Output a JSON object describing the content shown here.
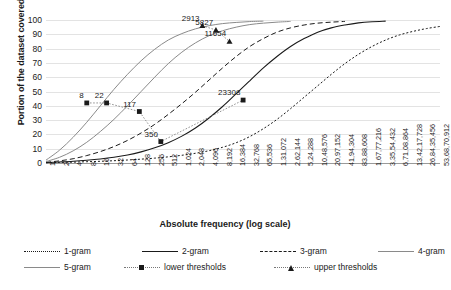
{
  "chart_data": {
    "type": "line",
    "title": "",
    "xlabel": "Absolute frequency (log scale)",
    "ylabel": "Portion of the dataset covered (%)",
    "xscale": "log2",
    "ylim": [
      0,
      100
    ],
    "yticks": [
      0,
      10,
      20,
      30,
      40,
      50,
      60,
      70,
      80,
      90,
      100
    ],
    "grid": true,
    "legend_position": "bottom",
    "xticks": [
      "1",
      "2",
      "4",
      "8",
      "16",
      "32",
      "64",
      "128",
      "256",
      "512",
      "1,024",
      "2,048",
      "4,096",
      "8,192",
      "16,384",
      "32,768",
      "65,536",
      "1,31,072",
      "2,62,144",
      "5,24,288",
      "10,48,576",
      "20,97,152",
      "41,94,304",
      "83,88,608",
      "1,67,77,216",
      "3,35,54,432",
      "6,71,08,864",
      "13,42,17,728",
      "26,84,35,456",
      "53,68,70,912"
    ],
    "xtick_values": [
      1,
      2,
      4,
      8,
      16,
      32,
      64,
      128,
      256,
      512,
      1024,
      2048,
      4096,
      8192,
      16384,
      32768,
      65536,
      131072,
      262144,
      524288,
      1048576,
      2097152,
      4194304,
      8388608,
      16777216,
      33554432,
      67108864,
      134217728,
      268435456,
      536870912
    ],
    "series": [
      {
        "name": "1-gram",
        "style": "dotted",
        "points": [
          [
            1,
            0.2
          ],
          [
            2,
            0.4
          ],
          [
            4,
            0.6
          ],
          [
            8,
            0.9
          ],
          [
            16,
            1.2
          ],
          [
            32,
            1.6
          ],
          [
            64,
            2.1
          ],
          [
            128,
            2.7
          ],
          [
            256,
            3.4
          ],
          [
            512,
            4.3
          ],
          [
            1024,
            5.4
          ],
          [
            2048,
            6.8
          ],
          [
            4096,
            8.6
          ],
          [
            8192,
            11.0
          ],
          [
            16384,
            14.2
          ],
          [
            32768,
            18.5
          ],
          [
            65536,
            24.0
          ],
          [
            131072,
            30.5
          ],
          [
            262144,
            38.0
          ],
          [
            524288,
            46.0
          ],
          [
            1048576,
            54.0
          ],
          [
            2097152,
            62.0
          ],
          [
            4194304,
            69.5
          ],
          [
            8388608,
            76.0
          ],
          [
            16777216,
            81.5
          ],
          [
            33554432,
            86.0
          ],
          [
            67108864,
            89.5
          ],
          [
            134217728,
            92.0
          ],
          [
            268435456,
            94.0
          ],
          [
            536870912,
            95.5
          ]
        ]
      },
      {
        "name": "2-gram",
        "style": "solid",
        "points": [
          [
            1,
            0.3
          ],
          [
            2,
            0.7
          ],
          [
            4,
            1.2
          ],
          [
            8,
            1.9
          ],
          [
            16,
            2.8
          ],
          [
            32,
            4.0
          ],
          [
            64,
            5.6
          ],
          [
            128,
            7.8
          ],
          [
            256,
            10.6
          ],
          [
            512,
            14.2
          ],
          [
            1024,
            18.8
          ],
          [
            2048,
            24.5
          ],
          [
            4096,
            31.5
          ],
          [
            8192,
            39.5
          ],
          [
            16384,
            48.5
          ],
          [
            32768,
            57.5
          ],
          [
            65536,
            66.5
          ],
          [
            131072,
            74.5
          ],
          [
            262144,
            81.5
          ],
          [
            524288,
            87.0
          ],
          [
            1048576,
            91.5
          ],
          [
            2097152,
            94.5
          ],
          [
            4194304,
            96.5
          ],
          [
            8388608,
            98.0
          ],
          [
            16777216,
            98.8
          ],
          [
            33554432,
            99.2
          ]
        ]
      },
      {
        "name": "3-gram",
        "style": "dashed",
        "points": [
          [
            1,
            0.5
          ],
          [
            2,
            1.5
          ],
          [
            4,
            3.0
          ],
          [
            8,
            5.2
          ],
          [
            16,
            8.0
          ],
          [
            32,
            11.5
          ],
          [
            64,
            15.8
          ],
          [
            128,
            21.0
          ],
          [
            256,
            27.0
          ],
          [
            512,
            34.0
          ],
          [
            1024,
            41.5
          ],
          [
            2048,
            49.5
          ],
          [
            4096,
            58.0
          ],
          [
            8192,
            66.5
          ],
          [
            16384,
            74.5
          ],
          [
            32768,
            81.5
          ],
          [
            65536,
            87.0
          ],
          [
            131072,
            91.5
          ],
          [
            262144,
            94.5
          ],
          [
            524288,
            96.5
          ],
          [
            1048576,
            97.8
          ],
          [
            2097152,
            98.5
          ],
          [
            4194304,
            99.0
          ]
        ]
      },
      {
        "name": "4-gram",
        "style": "solid-gray",
        "points": [
          [
            1,
            1.0
          ],
          [
            2,
            4.0
          ],
          [
            4,
            8.5
          ],
          [
            8,
            14.5
          ],
          [
            16,
            22.0
          ],
          [
            32,
            30.5
          ],
          [
            64,
            40.0
          ],
          [
            128,
            50.0
          ],
          [
            256,
            60.0
          ],
          [
            512,
            69.5
          ],
          [
            1024,
            77.5
          ],
          [
            2048,
            84.0
          ],
          [
            4096,
            89.0
          ],
          [
            8192,
            92.5
          ],
          [
            16384,
            95.0
          ],
          [
            32768,
            96.8
          ],
          [
            65536,
            97.8
          ],
          [
            131072,
            98.5
          ],
          [
            262144,
            99.0
          ]
        ]
      },
      {
        "name": "5-gram",
        "style": "solid-gray",
        "points": [
          [
            1,
            2.0
          ],
          [
            2,
            9.0
          ],
          [
            4,
            18.0
          ],
          [
            8,
            28.5
          ],
          [
            16,
            40.0
          ],
          [
            32,
            51.5
          ],
          [
            64,
            62.0
          ],
          [
            128,
            71.5
          ],
          [
            256,
            79.5
          ],
          [
            512,
            86.0
          ],
          [
            1024,
            90.5
          ],
          [
            2048,
            93.8
          ],
          [
            4096,
            96.0
          ],
          [
            8192,
            97.5
          ],
          [
            16384,
            98.3
          ],
          [
            32768,
            98.9
          ],
          [
            65536,
            99.2
          ]
        ]
      }
    ],
    "lower_thresholds": {
      "name": "lower thresholds",
      "marker": "square",
      "points": [
        {
          "x": 8,
          "y": 42.0,
          "label": "8"
        },
        {
          "x": 22,
          "y": 42.0,
          "label": "22"
        },
        {
          "x": 117,
          "y": 36.0,
          "label": "117"
        },
        {
          "x": 350,
          "y": 15.0,
          "label": "350"
        },
        {
          "x": 23308,
          "y": 44.0,
          "label": "23308"
        }
      ]
    },
    "upper_thresholds": {
      "name": "upper thresholds",
      "marker": "triangle",
      "points": [
        {
          "x": 2913,
          "y": 96.0,
          "label": "2913"
        },
        {
          "x": 5827,
          "y": 93.0,
          "label": "5827"
        },
        {
          "x": 11654,
          "y": 85.0,
          "label": "11654"
        }
      ]
    },
    "legend": [
      {
        "label": "1-gram",
        "style": "dotted",
        "marker": "none"
      },
      {
        "label": "2-gram",
        "style": "solid",
        "marker": "none"
      },
      {
        "label": "3-gram",
        "style": "dashed",
        "marker": "none"
      },
      {
        "label": "4-gram",
        "style": "solid-gray",
        "marker": "none"
      },
      {
        "label": "5-gram",
        "style": "solid-gray",
        "marker": "none"
      },
      {
        "label": "lower thresholds",
        "style": "dotted-thin",
        "marker": "square"
      },
      {
        "label": "upper thresholds",
        "style": "dotted-thin",
        "marker": "triangle"
      }
    ],
    "colors": {
      "dark": "#1a1a1a",
      "gray": "#8a8a8a",
      "grid": "#e3e3e3",
      "axis": "#9a9a9a"
    }
  }
}
